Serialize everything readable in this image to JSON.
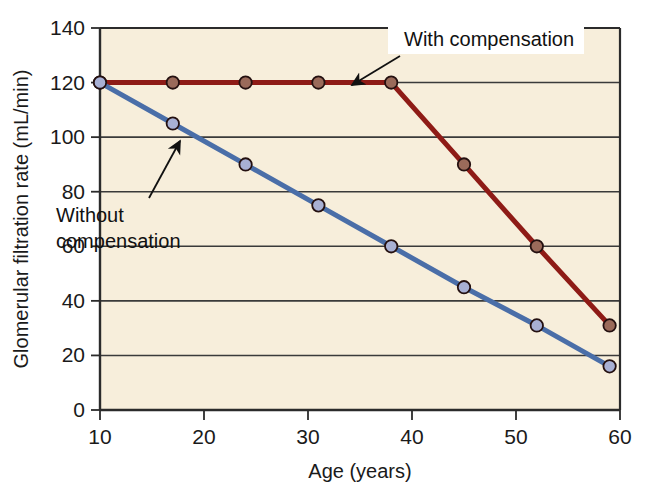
{
  "chart_data": {
    "type": "line",
    "title": "",
    "xlabel": "Age (years)",
    "ylabel": "Glomerular filtration rate (mL/min)",
    "xlim": [
      10,
      60
    ],
    "ylim": [
      0,
      140
    ],
    "xticks": [
      10,
      20,
      30,
      40,
      50,
      60
    ],
    "yticks": [
      0,
      20,
      40,
      60,
      80,
      100,
      120,
      140
    ],
    "grid": "horizontal",
    "legend_position": "inline-annotations",
    "plot_background": "#f7eedb",
    "series": [
      {
        "name": "With compensation",
        "color": "#8e1b16",
        "marker_fill": "#9a6a5a",
        "x": [
          10,
          17,
          24,
          31,
          38,
          45,
          52,
          59
        ],
        "y": [
          120,
          120,
          120,
          120,
          120,
          90,
          60,
          31
        ]
      },
      {
        "name": "Without compensation",
        "color": "#4a6ea8",
        "marker_fill": "#a8b0d4",
        "x": [
          10,
          17,
          24,
          31,
          38,
          45,
          52,
          59
        ],
        "y": [
          120,
          105,
          90,
          75,
          60,
          45,
          31,
          16
        ]
      }
    ],
    "annotations": [
      {
        "id": "with-compensation",
        "text": "With compensation",
        "text_x": 404,
        "text_y": 46,
        "arrow_from": [
          400,
          54
        ],
        "arrow_to": [
          352,
          85
        ]
      },
      {
        "id": "without-compensation",
        "line1": "Without",
        "line2": "compensation",
        "text_x": 56,
        "text_y": 222,
        "arrow_from": [
          149,
          198
        ],
        "arrow_to": [
          179,
          142
        ]
      }
    ]
  },
  "axis": {
    "y_tick_labels": [
      "140",
      "120",
      "100",
      "80",
      "60",
      "40",
      "20",
      "0"
    ],
    "x_tick_labels": [
      "10",
      "20",
      "30",
      "40",
      "50",
      "60"
    ],
    "x_title": "Age (years)",
    "y_title": "Glomerular filtration rate (mL/min)"
  },
  "colors": {
    "with_compensation_line": "#8e1b16",
    "without_compensation_line": "#4a6ea8",
    "plot_bg": "#f7eedb",
    "axis": "#2b2b2b",
    "gridline": "#3a3a3a"
  }
}
